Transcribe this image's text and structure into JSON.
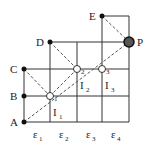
{
  "diagram": {
    "points": [
      {
        "id": "A",
        "label": "A",
        "x": 24,
        "y": 122,
        "lx": 10,
        "ly": 126
      },
      {
        "id": "B",
        "label": "B",
        "x": 24,
        "y": 96,
        "lx": 10,
        "ly": 100
      },
      {
        "id": "C",
        "label": "C",
        "x": 24,
        "y": 69,
        "lx": 10,
        "ly": 73
      },
      {
        "id": "D",
        "label": "D",
        "x": 50,
        "y": 42,
        "lx": 36,
        "ly": 46
      },
      {
        "id": "E",
        "label": "E",
        "x": 102,
        "y": 16,
        "lx": 89,
        "ly": 20
      },
      {
        "id": "P",
        "label": "P",
        "x": 129,
        "y": 42,
        "lx": 137,
        "ly": 46
      }
    ],
    "nodes": [
      {
        "id": "O1",
        "label": "O",
        "sub": "1",
        "x": 50,
        "y": 96
      },
      {
        "id": "O2",
        "label": "O",
        "sub": "2",
        "x": 77,
        "y": 69
      },
      {
        "id": "O3",
        "label": "O",
        "sub": "3",
        "x": 102,
        "y": 69
      }
    ],
    "intervals": [
      {
        "label": "I",
        "sub": "1",
        "x": 53,
        "y": 116
      },
      {
        "label": "I",
        "sub": "2",
        "x": 80,
        "y": 89
      },
      {
        "label": "I",
        "sub": "3",
        "x": 105,
        "y": 89
      }
    ],
    "epsilons": [
      {
        "label": "ε",
        "sub": "1",
        "x": 33,
        "y": 138
      },
      {
        "label": "ε",
        "sub": "2",
        "x": 59,
        "y": 138
      },
      {
        "label": "ε",
        "sub": "3",
        "x": 86,
        "y": 138
      },
      {
        "label": "ε",
        "sub": "4",
        "x": 111,
        "y": 138
      }
    ],
    "colors": {
      "line": "#333333",
      "dashed": "#555555",
      "point": "#111111"
    }
  }
}
